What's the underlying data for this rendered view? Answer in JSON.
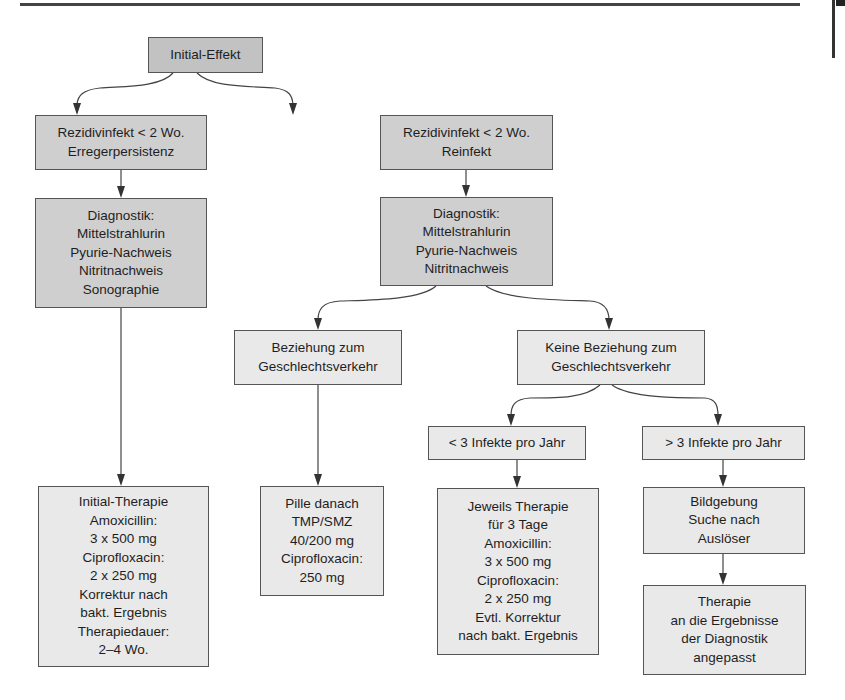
{
  "colors": {
    "primary_box": "#cfcfcf",
    "secondary_box": "#e9e9e9",
    "border": "#555555",
    "arrow": "#333333"
  },
  "diagram": {
    "type": "flowchart",
    "nodes": {
      "initial_effekt": {
        "lines": [
          "Initial-Effekt"
        ]
      },
      "erregerpersistenz": {
        "lines": [
          "Rezidivinfekt < 2 Wo.",
          "Erregerpersistenz"
        ]
      },
      "reinfekt": {
        "lines": [
          "Rezidivinfekt < 2 Wo.",
          "Reinfekt"
        ]
      },
      "diagnostik_left": {
        "lines": [
          "Diagnostik:",
          "Mittelstrahlurin",
          "Pyurie-Nachweis",
          "Nitritnachweis",
          "Sonographie"
        ]
      },
      "diagnostik_right": {
        "lines": [
          "Diagnostik:",
          "Mittelstrahlurin",
          "Pyurie-Nachweis",
          "Nitritnachweis"
        ]
      },
      "beziehung": {
        "lines": [
          "Beziehung zum",
          "Geschlechtsverkehr"
        ]
      },
      "keine_beziehung": {
        "lines": [
          "Keine Beziehung zum",
          "Geschlechtsverkehr"
        ]
      },
      "weniger_3": {
        "lines": [
          "< 3 Infekte pro Jahr"
        ]
      },
      "mehr_3": {
        "lines": [
          "> 3 Infekte pro Jahr"
        ]
      },
      "initial_therapie": {
        "lines": [
          "Initial-Therapie",
          "Amoxicillin:",
          "3 x 500 mg",
          "Ciprofloxacin:",
          "2 x 250 mg",
          "Korrektur nach",
          "bakt. Ergebnis",
          "Therapiedauer:",
          "2–4 Wo."
        ]
      },
      "pille_danach": {
        "lines": [
          "Pille danach",
          "TMP/SMZ",
          "40/200 mg",
          "Ciprofloxacin:",
          "250 mg"
        ]
      },
      "jeweils_therapie": {
        "lines": [
          "Jeweils Therapie",
          "für 3 Tage",
          "Amoxicillin:",
          "3 x 500 mg",
          "Ciprofloxacin:",
          "2 x 250 mg",
          "Evtl. Korrektur",
          "nach bakt. Ergebnis"
        ]
      },
      "bildgebung": {
        "lines": [
          "Bildgebung",
          "Suche nach",
          "Auslöser"
        ]
      },
      "therapie_angepasst": {
        "lines": [
          "Therapie",
          "an die Ergebnisse",
          "der Diagnostik",
          "angepasst"
        ]
      }
    },
    "edges": [
      [
        "initial_effekt",
        "erregerpersistenz"
      ],
      [
        "initial_effekt",
        "reinfekt"
      ],
      [
        "erregerpersistenz",
        "diagnostik_left"
      ],
      [
        "reinfekt",
        "diagnostik_right"
      ],
      [
        "diagnostik_left",
        "initial_therapie"
      ],
      [
        "diagnostik_right",
        "beziehung"
      ],
      [
        "diagnostik_right",
        "keine_beziehung"
      ],
      [
        "beziehung",
        "pille_danach"
      ],
      [
        "keine_beziehung",
        "weniger_3"
      ],
      [
        "keine_beziehung",
        "mehr_3"
      ],
      [
        "weniger_3",
        "jeweils_therapie"
      ],
      [
        "mehr_3",
        "bildgebung"
      ],
      [
        "bildgebung",
        "therapie_angepasst"
      ]
    ]
  }
}
